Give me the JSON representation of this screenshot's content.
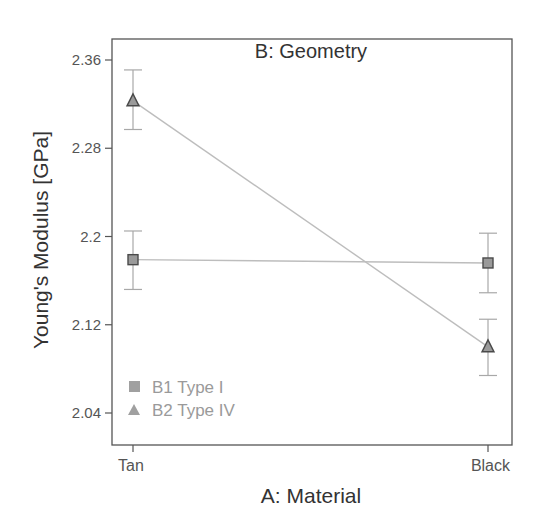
{
  "chart_data": {
    "type": "line",
    "title": "B: Geometry",
    "xlabel": "A: Material",
    "ylabel": "Young's Modulus [GPa]",
    "categories": [
      "Tan",
      "Black"
    ],
    "ylim": [
      2.02,
      2.38
    ],
    "yticks": [
      2.36,
      2.28,
      2.2,
      2.12,
      2.04
    ],
    "ytick_labels": [
      "2.36",
      "2.28",
      "2.2",
      "2.12",
      "2.04"
    ],
    "grid": false,
    "legend_position": "lower-left-inside",
    "series": [
      {
        "name": "B1 Type I",
        "marker": "square",
        "values": [
          2.179,
          2.176
        ],
        "error_low": [
          2.152,
          2.149
        ],
        "error_high": [
          2.205,
          2.203
        ]
      },
      {
        "name": "B2 Type IV",
        "marker": "triangle",
        "values": [
          2.323,
          2.1
        ],
        "error_low": [
          2.297,
          2.074
        ],
        "error_high": [
          2.351,
          2.125
        ]
      }
    ]
  },
  "colors": {
    "axis": "#555555",
    "line": "#bdbdbd",
    "error_bar": "#a8a8a8",
    "marker_fill": "#9a9a9a",
    "marker_stroke": "#4a4a4a",
    "legend_text": "#9a9a9a"
  }
}
